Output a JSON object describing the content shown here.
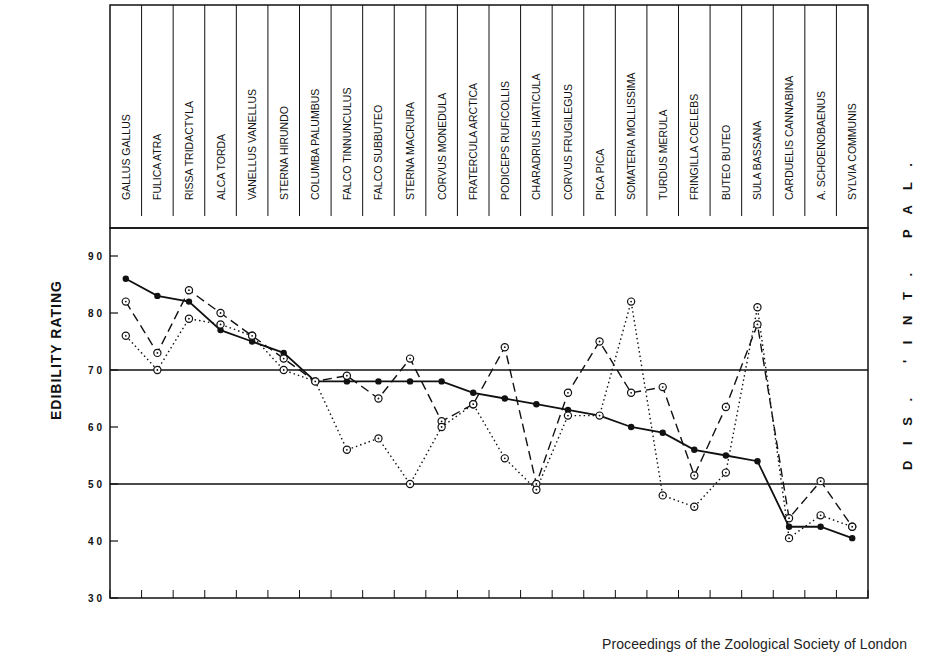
{
  "chart_data": {
    "type": "line",
    "title": "",
    "ylabel": "EDIBILITY RATING",
    "right_label": "DIS. 'INT. PAL.",
    "xlabel": "",
    "ylim": [
      30,
      90
    ],
    "yticks": [
      30,
      40,
      50,
      60,
      70,
      80,
      90
    ],
    "reference_lines": [
      50,
      70
    ],
    "grid": false,
    "categories": [
      "GALLUS GALLUS",
      "FULICA ATRA",
      "RISSA TRIDACTYLA",
      "ALCA TORDA",
      "VANELLUS VANELLUS",
      "STERNA HIRUNDO",
      "COLUMBA PALUMBUS",
      "FALCO TINNUNCULUS",
      "FALCO SUBBUTEO",
      "STERNA MACRURA",
      "CORVUS MONEDULA",
      "FRATERCULA ARCTICA",
      "PODICEPS RUFICOLLIS",
      "CHARADRIUS HIATICULA",
      "CORVUS FRUGILEGUS",
      "PICA PICA",
      "SOMATERIA MOLLISSIMA",
      "TURDUS MERULA",
      "FRINGILLA COELEBS",
      "BUTEO BUTEO",
      "SULA BASSANA",
      "CARDUELIS CANNABINA",
      "A. SCHOENOBAENUS",
      "SYLVIA COMMUNIS"
    ],
    "series": [
      {
        "name": "solid (filled dots)",
        "style": "solid",
        "marker": "filled",
        "values": [
          86,
          83,
          82,
          77,
          75,
          73,
          68,
          68,
          68,
          68,
          68,
          66,
          65,
          64,
          63,
          62,
          60,
          59,
          56,
          55,
          54,
          42.5,
          42.5,
          40.5
        ]
      },
      {
        "name": "dashed (open circles)",
        "style": "dashed",
        "marker": "open",
        "values": [
          82,
          73,
          84,
          80,
          76,
          72,
          68,
          69,
          65,
          72,
          61,
          64,
          74,
          50,
          66,
          75,
          66,
          67,
          51.5,
          63.5,
          78,
          44,
          50.5,
          42.5
        ]
      },
      {
        "name": "dotted (open circles)",
        "style": "dotted",
        "marker": "open",
        "values": [
          76,
          70,
          79,
          78,
          76,
          70,
          68,
          56,
          58,
          50,
          60,
          64,
          54.5,
          49,
          62,
          62,
          82,
          48,
          46,
          52,
          81,
          40.5,
          44.5,
          42.5
        ]
      }
    ]
  },
  "text": {
    "ylabel": "EDIBILITY RATING",
    "right_label": "D I S .   ' I N T .   P A L .",
    "caption": "Proceedings of the Zoological Society of London"
  }
}
